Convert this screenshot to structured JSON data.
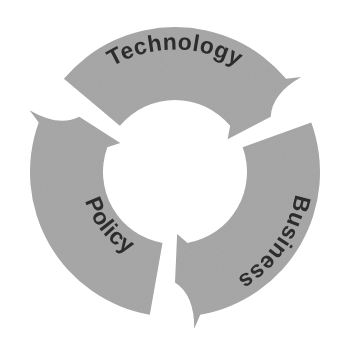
{
  "diagram": {
    "type": "cyclical-process",
    "title_visible": false,
    "background_color": "#ffffff",
    "segment_fill_color": "#a8a8a8",
    "label_text_color": "#2c2c2c",
    "hub_color": "#ffffff",
    "segment_count": 3,
    "direction": "clockwise",
    "geometry": {
      "center_x": 175,
      "center_y": 172,
      "outer_radius": 145,
      "inner_radius": 72,
      "segment_sweep_degrees": 100,
      "gap_degrees": 20
    },
    "segments": [
      {
        "id": "technology",
        "label": "Technology",
        "position": "top",
        "start_angle": -140,
        "end_angle": -40,
        "label_orientation": "along-arc-upright",
        "arrow_tip_angle": -30
      },
      {
        "id": "business",
        "label": "Business",
        "position": "right",
        "start_angle": -20,
        "end_angle": 80,
        "label_orientation": "along-arc-reading-down",
        "arrow_tip_angle": 90
      },
      {
        "id": "policy",
        "label": "Policy",
        "position": "left",
        "start_angle": 100,
        "end_angle": 200,
        "label_orientation": "along-arc-reading-up",
        "arrow_tip_angle": 210
      }
    ]
  }
}
